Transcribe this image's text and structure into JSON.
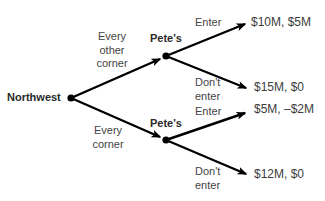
{
  "diagram": {
    "type": "game-tree",
    "colors": {
      "line": "#000000",
      "node": "#000000",
      "node_label": "#2a2a2a",
      "text": "#3c3c3c",
      "background": "#ffffff"
    },
    "root": {
      "label": "Northwest",
      "branches": [
        {
          "label_lines": [
            "Every",
            "other",
            "corner"
          ],
          "node": {
            "label": "Pete's",
            "branches": [
              {
                "label_lines": [
                  "Enter"
                ],
                "payoff": "$10M, $5M"
              },
              {
                "label_lines": [
                  "Don't",
                  "enter"
                ],
                "payoff": "$15M, $0"
              }
            ]
          }
        },
        {
          "label_lines": [
            "Every",
            "corner"
          ],
          "node": {
            "label": "Pete's",
            "branches": [
              {
                "label_lines": [
                  "Enter"
                ],
                "payoff": "$5M, –$2M"
              },
              {
                "label_lines": [
                  "Don't",
                  "enter"
                ],
                "payoff": "$12M, $0"
              }
            ]
          }
        }
      ]
    }
  }
}
